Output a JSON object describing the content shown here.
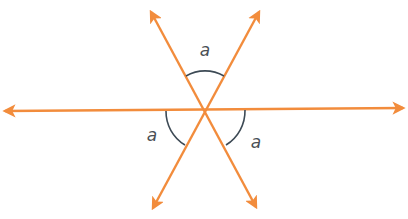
{
  "diagram": {
    "colors": {
      "line": "#f28c3c",
      "arc": "#3d4a55",
      "label": "#4a4f55",
      "background": "#ffffff"
    },
    "center": {
      "x": 205,
      "y": 110
    },
    "lines": [
      {
        "id": "horizontal",
        "from": {
          "x": 5,
          "y": 111
        },
        "to": {
          "x": 403,
          "y": 108
        },
        "arrows": "both"
      },
      {
        "id": "diag-down-right",
        "from": {
          "x": 151,
          "y": 12
        },
        "to": {
          "x": 256,
          "y": 207
        },
        "arrows": "both"
      },
      {
        "id": "diag-down-left",
        "from": {
          "x": 259,
          "y": 12
        },
        "to": {
          "x": 153,
          "y": 208
        },
        "arrows": "both"
      }
    ],
    "angles": [
      {
        "id": "top",
        "label": "a",
        "label_pos": {
          "x": 205,
          "y": 56
        }
      },
      {
        "id": "bottom-left",
        "label": "a",
        "label_pos": {
          "x": 152,
          "y": 141
        }
      },
      {
        "id": "bottom-right",
        "label": "a",
        "label_pos": {
          "x": 256,
          "y": 148
        }
      }
    ]
  }
}
